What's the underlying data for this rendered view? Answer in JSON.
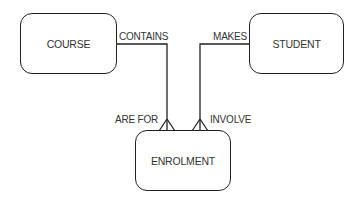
{
  "diagram": {
    "type": "entity-relationship",
    "entities": [
      {
        "id": "course",
        "label": "COURSE"
      },
      {
        "id": "student",
        "label": "STUDENT"
      },
      {
        "id": "enrolment",
        "label": "ENROLMENT"
      }
    ],
    "relationships": [
      {
        "from": "course",
        "to": "enrolment",
        "from_label": "CONTAINS",
        "to_label": "ARE FOR",
        "cardinality": "one-to-many"
      },
      {
        "from": "student",
        "to": "enrolment",
        "from_label": "MAKES",
        "to_label": "INVOLVE",
        "cardinality": "one-to-many"
      }
    ],
    "colors": {
      "line": "#222222",
      "text": "#333333",
      "background": "#ffffff"
    }
  }
}
